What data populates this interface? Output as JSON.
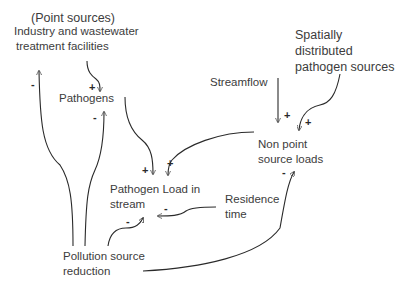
{
  "diagram": {
    "type": "causal-loop-diagram",
    "nodes": {
      "point_sources": {
        "lines": [
          "(Point sources)",
          "Industry and wastewater",
          "treatment facilities"
        ]
      },
      "pathogens": {
        "lines": [
          "Pathogens"
        ]
      },
      "streamflow": {
        "lines": [
          "Streamflow"
        ]
      },
      "spatial_sources": {
        "lines": [
          "Spatially",
          "distributed",
          "pathogen sources"
        ]
      },
      "non_point": {
        "lines": [
          "Non point",
          "source loads"
        ]
      },
      "pathogen_load": {
        "lines": [
          "Pathogen Load in",
          "stream"
        ]
      },
      "residence_time": {
        "lines": [
          "Residence",
          "time"
        ]
      },
      "pollution_reduction": {
        "lines": [
          "Pollution source",
          "reduction"
        ]
      }
    },
    "edges": [
      {
        "from": "Pollution source reduction",
        "to": "Industry and wastewater treatment facilities",
        "sign": "-"
      },
      {
        "from": "Pollution source reduction",
        "to": "Pathogens",
        "sign": "-"
      },
      {
        "from": "Industry and wastewater treatment facilities",
        "to": "Pathogens",
        "sign": "+"
      },
      {
        "from": "Pathogens",
        "to": "Pathogen Load in stream",
        "sign": "+"
      },
      {
        "from": "Non point source loads",
        "to": "Pathogen Load in stream",
        "sign": "+"
      },
      {
        "from": "Streamflow",
        "to": "Non point source loads",
        "sign": "+"
      },
      {
        "from": "Spatially distributed pathogen sources",
        "to": "Non point source loads",
        "sign": "+"
      },
      {
        "from": "Residence time",
        "to": "Pathogen Load in stream",
        "sign": "-"
      },
      {
        "from": "Pollution source reduction",
        "to": "Pathogen Load in stream",
        "sign": "-"
      },
      {
        "from": "Pollution source reduction",
        "to": "Non point source loads",
        "sign": "-"
      }
    ]
  }
}
